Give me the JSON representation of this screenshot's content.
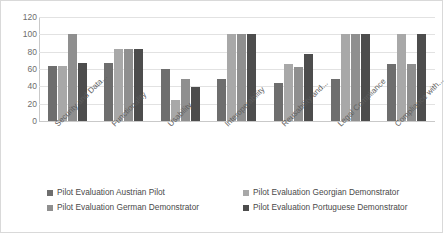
{
  "chart_data": {
    "type": "bar",
    "title": "",
    "xlabel": "",
    "ylabel": "",
    "ylim": [
      0,
      120
    ],
    "yticks": [
      120,
      100,
      80,
      60,
      40,
      20,
      0
    ],
    "grid": true,
    "legend_position": "bottom",
    "categories": [
      "Security and Data...",
      "Functionality",
      "Usability",
      "Interoperability",
      "Reusability and...",
      "Legal Compliance",
      "Compliance with..."
    ],
    "series": [
      {
        "name": "Pilot Evaluation Austrian Pilot",
        "color": "#6e6e6e",
        "values": [
          63,
          67,
          60,
          49,
          44,
          49,
          66
        ]
      },
      {
        "name": "Pilot Evaluation Georgian Demonstrator",
        "color": "#a8a8a8",
        "values": [
          63,
          83,
          24,
          100,
          66,
          100,
          100
        ]
      },
      {
        "name": "Pilot Evaluation German Demonstrator",
        "color": "#8f8f8f",
        "values": [
          100,
          83,
          49,
          100,
          62,
          100,
          66
        ]
      },
      {
        "name": "Pilot Evaluation Portuguese Demonstrator",
        "color": "#4d4d4d",
        "values": [
          67,
          83,
          39,
          100,
          77,
          100,
          100
        ]
      }
    ]
  },
  "legend": {
    "items": [
      "Pilot Evaluation Austrian Pilot",
      "Pilot Evaluation Georgian Demonstrator",
      "Pilot Evaluation German Demonstrator",
      "Pilot Evaluation Portuguese Demonstrator"
    ]
  }
}
